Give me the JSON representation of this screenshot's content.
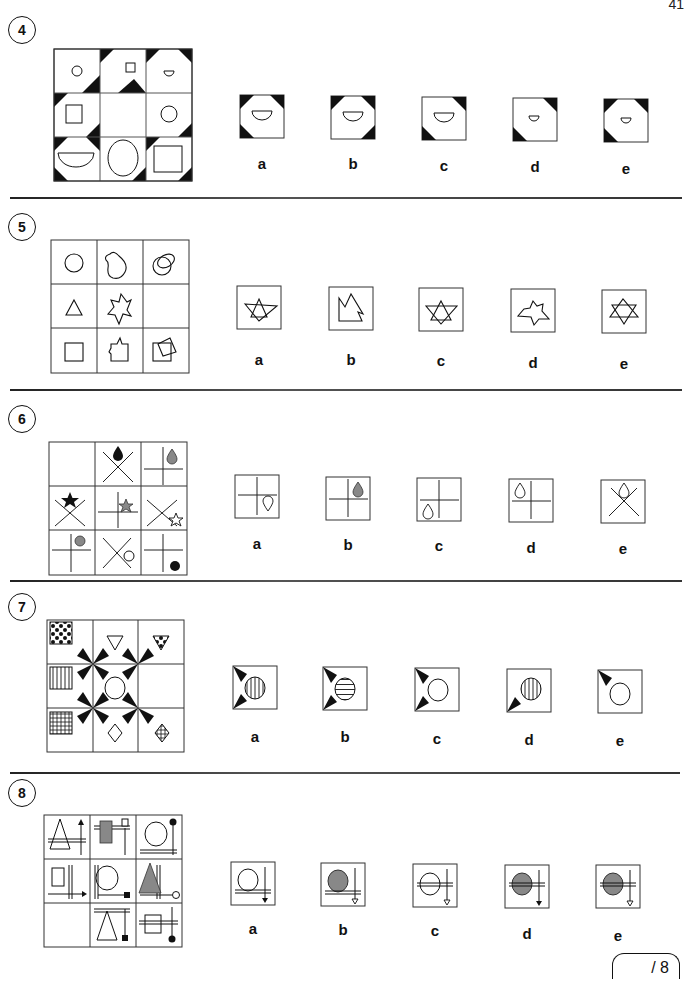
{
  "page": {
    "number": "41",
    "score_label": "/ 8"
  },
  "questions": [
    {
      "number": "4",
      "options": [
        "a",
        "b",
        "c",
        "d",
        "e"
      ]
    },
    {
      "number": "5",
      "options": [
        "a",
        "b",
        "c",
        "d",
        "e"
      ]
    },
    {
      "number": "6",
      "options": [
        "a",
        "b",
        "c",
        "d",
        "e"
      ]
    },
    {
      "number": "7",
      "options": [
        "a",
        "b",
        "c",
        "d",
        "e"
      ]
    },
    {
      "number": "8",
      "options": [
        "a",
        "b",
        "c",
        "d",
        "e"
      ]
    }
  ],
  "colors": {
    "ink": "#111111",
    "grey_fill": "#808080",
    "grid_line": "#555555"
  }
}
